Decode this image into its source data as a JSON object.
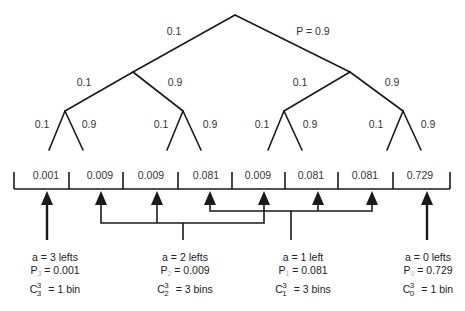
{
  "tree": {
    "root_edges": {
      "left": "0.1",
      "right": "P = 0.9"
    },
    "level2_edges": [
      {
        "left": "0.1",
        "right": "0.9"
      },
      {
        "left": "0.1",
        "right": "0.9"
      }
    ],
    "level3_edges": [
      {
        "left": "0.1",
        "right": "0.9"
      },
      {
        "left": "0.1",
        "right": "0.9"
      },
      {
        "left": "0.1",
        "right": "0.9"
      },
      {
        "left": "0.1",
        "right": "0.9"
      }
    ]
  },
  "bins": [
    "0.001",
    "0.009",
    "0.009",
    "0.081",
    "0.009",
    "0.081",
    "0.081",
    "0.729"
  ],
  "groups": [
    {
      "a_label": "a = 3 lefts",
      "p_name": "P",
      "p_sub": "3",
      "p_value": "= 0.001",
      "c_name": "C",
      "c_sup": "3",
      "c_sub": "3",
      "c_value": "= 1 bin"
    },
    {
      "a_label": "a = 2 lefts",
      "p_name": "P",
      "p_sub": "2",
      "p_value": "= 0.009",
      "c_name": "C",
      "c_sup": "3",
      "c_sub": "2",
      "c_value": "= 3 bins"
    },
    {
      "a_label": "a = 1 left",
      "p_name": "P",
      "p_sub": "1",
      "p_value": "= 0.081",
      "c_name": "C",
      "c_sup": "3",
      "c_sub": "1",
      "c_value": "= 3 bins"
    },
    {
      "a_label": "a = 0 lefts",
      "p_name": "P",
      "p_sub": "0",
      "p_value": "= 0.729",
      "c_name": "C",
      "c_sup": "3",
      "c_sub": "0",
      "c_value": "= 1 bin"
    }
  ],
  "colors": {
    "line": "#1a1a1a",
    "text": "#333333",
    "subscript": "#aaaaaa"
  }
}
